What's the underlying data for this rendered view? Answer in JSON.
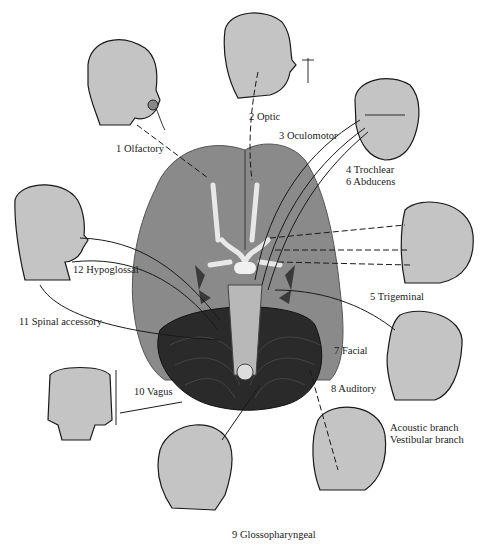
{
  "figure": {
    "colors": {
      "background": "#ffffff",
      "skin": "#c4c4c4",
      "brain": "#8a8a8a",
      "cerebellum": "#2a2a2a",
      "nerve_tracts": "#e8e8e8",
      "ink": "#1a1a1a"
    }
  },
  "labels": [
    {
      "id": "olfactory",
      "number": "1",
      "name": "Olfactory",
      "text": "1 Olfactory"
    },
    {
      "id": "optic",
      "number": "2",
      "name": "Optic",
      "text": "2 Optic"
    },
    {
      "id": "oculomotor",
      "number": "3",
      "name": "Oculomotor",
      "text": "3 Oculomotor"
    },
    {
      "id": "trochlear",
      "number": "4",
      "name": "Trochlear",
      "text": "4 Trochlear"
    },
    {
      "id": "abducens",
      "number": "6",
      "name": "Abducens",
      "text": "6 Abducens"
    },
    {
      "id": "trigeminal",
      "number": "5",
      "name": "Trigeminal",
      "text": "5 Trigeminal"
    },
    {
      "id": "hypoglossal",
      "number": "12",
      "name": "Hypoglossal",
      "text": "12 Hypoglossal"
    },
    {
      "id": "spinal-accessory",
      "number": "11",
      "name": "Spinal accessory",
      "text": "11 Spinal accessory"
    },
    {
      "id": "facial",
      "number": "7",
      "name": "Facial",
      "text": "7 Facial"
    },
    {
      "id": "vagus",
      "number": "10",
      "name": "Vagus",
      "text": "10 Vagus"
    },
    {
      "id": "auditory",
      "number": "8",
      "name": "Auditory",
      "text": "8 Auditory"
    },
    {
      "id": "acoustic-branch",
      "number": "",
      "name": "Acoustic branch",
      "text": "Acoustic branch"
    },
    {
      "id": "vestibular-branch",
      "number": "",
      "name": "Vestibular branch",
      "text": "Vestibular branch"
    },
    {
      "id": "glossopharyngeal",
      "number": "9",
      "name": "Glossopharyngeal",
      "text": "9 Glossopharyngeal"
    }
  ],
  "illustrations": [
    {
      "id": "head-smelling-flower",
      "nerve": "olfactory"
    },
    {
      "id": "head-profile-viewing-flower",
      "nerve": "optic"
    },
    {
      "id": "head-front-eye-muscles",
      "nerve": "oculomotor/trochlear/abducens"
    },
    {
      "id": "head-face-sensory",
      "nerve": "trigeminal"
    },
    {
      "id": "head-neck-muscles",
      "nerve": "hypoglossal/spinal accessory"
    },
    {
      "id": "torso-organs",
      "nerve": "vagus"
    },
    {
      "id": "head-profile-facial",
      "nerve": "facial"
    },
    {
      "id": "head-ear-sound",
      "nerve": "auditory"
    },
    {
      "id": "head-throat",
      "nerve": "glossopharyngeal"
    },
    {
      "id": "brain-inferior-view",
      "nerve": "all"
    }
  ]
}
